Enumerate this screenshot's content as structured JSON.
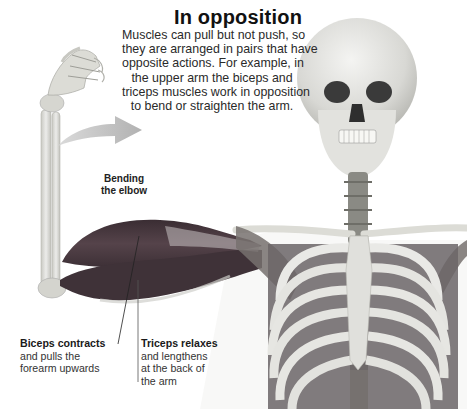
{
  "title": "In opposition",
  "intro_lines": [
    "Muscles can pull but not push, so",
    "they are arranged in pairs that have",
    "opposite actions. For example, in",
    "the upper arm the biceps and",
    "triceps muscles work in opposition",
    "to bend or straighten the arm."
  ],
  "arrow_label": {
    "lines": [
      "Bending",
      "the elbow"
    ]
  },
  "callouts": {
    "biceps": {
      "heading": "Biceps contracts",
      "lines": [
        "and pulls the",
        "forearm upwards"
      ]
    },
    "triceps": {
      "heading": "Triceps relaxes",
      "lines": [
        "and lengthens",
        "at the back of",
        "the arm"
      ]
    }
  },
  "colors": {
    "background": "#ffffff",
    "muscle": "#4a3a40",
    "bone": "#dcdcd6",
    "arrow": "#b8b8b8",
    "text": "#222222"
  },
  "icons": {
    "arrow": "curved-arrow-right"
  }
}
